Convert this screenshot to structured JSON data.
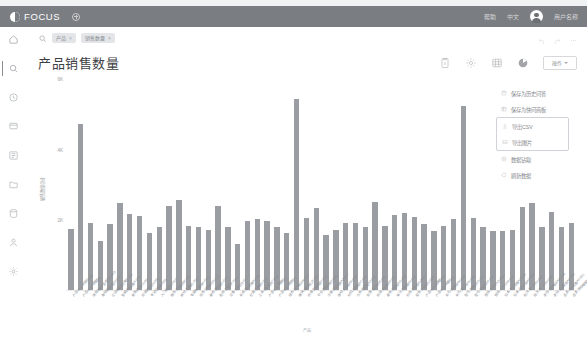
{
  "topbar": {
    "brand": "FOCUS",
    "add_icon": "plus-circle-icon",
    "links": [
      "帮助",
      "中文"
    ],
    "user_name": "用户名称",
    "avatar_icon": "avatar-icon"
  },
  "sidebar": {
    "items": [
      {
        "name": "home",
        "icon": "home-icon",
        "active": false
      },
      {
        "name": "search",
        "icon": "search-icon",
        "active": true
      },
      {
        "name": "history",
        "icon": "clock-icon",
        "active": false
      },
      {
        "name": "answers",
        "icon": "chat-icon",
        "active": false
      },
      {
        "name": "boards",
        "icon": "list-icon",
        "active": false
      },
      {
        "name": "folders",
        "icon": "folder-icon",
        "active": false
      },
      {
        "name": "data",
        "icon": "database-icon",
        "active": false
      },
      {
        "name": "users",
        "icon": "user-icon",
        "active": false
      },
      {
        "name": "settings",
        "icon": "gear-icon",
        "active": false
      }
    ]
  },
  "search": {
    "icon": "search-icon",
    "chips": [
      {
        "label": "产品",
        "remove": "×"
      },
      {
        "label": "销售数量",
        "remove": "×"
      }
    ],
    "right_icons": [
      "undo-icon",
      "redo-icon",
      "more-icon"
    ]
  },
  "header": {
    "title": "产品销售数量",
    "toolbar_icons": [
      "info-icon",
      "gear-icon",
      "table-icon",
      "pie-chart-icon"
    ],
    "view_button": {
      "label": "操作",
      "caret": "chevron-down-icon"
    }
  },
  "menu": {
    "items": [
      {
        "label": "保存为历史问答",
        "icon": "save-icon",
        "grouped": false
      },
      {
        "label": "保存为快问画板",
        "icon": "board-icon",
        "grouped": false
      },
      {
        "label": "导出CSV",
        "icon": "download-icon",
        "grouped": true
      },
      {
        "label": "导出图片",
        "icon": "image-icon",
        "grouped": true
      },
      {
        "label": "数据钻取",
        "icon": "drill-icon",
        "grouped": false
      },
      {
        "label": "刷新数据",
        "icon": "refresh-icon",
        "grouped": false
      }
    ]
  },
  "chart_data": {
    "type": "bar",
    "title": "产品销售数量",
    "xlabel": "产品",
    "ylabel": "销售数量总计",
    "ylim": [
      0,
      6000
    ],
    "yticks": [
      0,
      2000,
      4000,
      6000
    ],
    "ytick_labels": [
      "0",
      "2K",
      "4K",
      "6K"
    ],
    "grid": false,
    "legend": "none",
    "bar_color": "#9a9da1",
    "categories": [
      "产品-001-标准版A型",
      "产品-002-增强型B",
      "高级定制产品系列C-003",
      "基础套装产品D-004",
      "企业级解决方案E-005",
      "智能终端设备F-006",
      "便携式组件G-007",
      "标准配件包H-008",
      "专业版模块I-009",
      "入门级套件J-010",
      "服务-高级支持K-011",
      "耗材-常规类L-012",
      "零部件-通用M-013",
      "软件-授权许可N-014",
      "硬件-服务器O-015",
      "配件-扩展坞P-016",
      "设备-监测仪Q-017",
      "系统-集成方案R-018",
      "仪器-检测类S-019",
      "工具-维护套装T-020",
      "产品-021-旗舰版U",
      "产品-022-精简版V",
      "组件-核心单元W-023",
      "模块-通信接口X-024",
      "终端-智能网关Y-025",
      "平台-数据分析Z-026",
      "方案-行业定制AA-027",
      "器材-工业级AB-028",
      "材料-高强度AC-029",
      "元件-精密型AD-030",
      "装置-自动化AE-031",
      "机组-大功率AF-032",
      "部件-耐磨型AG-033",
      "单元-控制器AH-034",
      "附件-安装包AI-035",
      "套件-升级版AJ-036",
      "产品-037-经典款AK",
      "产品-038-限量版AL",
      "系列-高端线AM-039",
      "系列-普及线AN-040",
      "型号-重载式AO-041",
      "型号-轻便式AP-042",
      "规格-大尺寸AQ-043",
      "规格-小尺寸AR-044",
      "版本-专业增强AS-045",
      "版本-社区开源AT-046",
      "批次-第一代AU-047",
      "批次-第二代AV-048",
      "类别-消费电子AW-049",
      "类别-工业制造AX-050",
      "品类-办公设备AY-051",
      "品类-家用电器AZ-052"
    ],
    "values": [
      1720,
      4700,
      1900,
      1400,
      1880,
      2450,
      2150,
      2090,
      1620,
      1790,
      2380,
      2560,
      1800,
      1770,
      1690,
      2390,
      1780,
      1290,
      1940,
      2020,
      1950,
      1780,
      1600,
      5400,
      2050,
      2320,
      1570,
      1700,
      1910,
      1900,
      1790,
      2480,
      1800,
      2130,
      2180,
      2070,
      1860,
      1680,
      1810,
      2000,
      5200,
      2030,
      1790,
      1680,
      1670,
      1710,
      2340,
      2470,
      1770,
      2220,
      1780,
      1900
    ]
  }
}
